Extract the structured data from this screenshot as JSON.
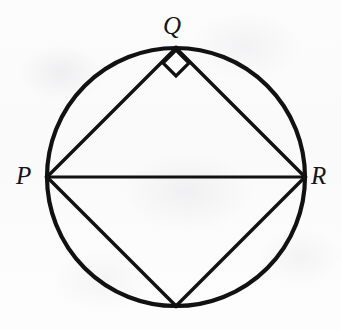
{
  "figure": {
    "kind": "geometry-diagram",
    "canvas": {
      "width": 341,
      "height": 330
    },
    "background_color": "#fdfdfd",
    "stroke_color": "#111111"
  },
  "circle": {
    "name": "circumscribed-circle",
    "center_x": 176,
    "center_y": 177,
    "radius": 129,
    "stroke_width": 4.2
  },
  "points": [
    {
      "id": "P",
      "label": "P",
      "x": 47,
      "y": 177,
      "labeled": true,
      "label_x": 16,
      "label_y": 163
    },
    {
      "id": "Q",
      "label": "Q",
      "x": 176,
      "y": 48,
      "labeled": true,
      "label_x": 163,
      "label_y": 13
    },
    {
      "id": "R",
      "label": "R",
      "x": 305,
      "y": 177,
      "labeled": true,
      "label_x": 311,
      "label_y": 163
    },
    {
      "id": "S",
      "label": "",
      "x": 176,
      "y": 306,
      "labeled": false,
      "label_x": 0,
      "label_y": 0
    }
  ],
  "segments": [
    {
      "name": "segment-PQ",
      "from": "P",
      "to": "Q",
      "x1": 47,
      "y1": 177,
      "x2": 176,
      "y2": 48,
      "stroke_width": 3.4
    },
    {
      "name": "segment-QR",
      "from": "Q",
      "to": "R",
      "x1": 176,
      "y1": 48,
      "x2": 305,
      "y2": 177,
      "stroke_width": 3.4
    },
    {
      "name": "segment-PR-diameter",
      "from": "P",
      "to": "R",
      "x1": 47,
      "y1": 177,
      "x2": 305,
      "y2": 177,
      "stroke_width": 3.2
    },
    {
      "name": "segment-PS",
      "from": "P",
      "to": "S",
      "x1": 47,
      "y1": 177,
      "x2": 176,
      "y2": 306,
      "stroke_width": 3.4
    },
    {
      "name": "segment-SR",
      "from": "S",
      "to": "R",
      "x1": 176,
      "y1": 306,
      "x2": 305,
      "y2": 177,
      "stroke_width": 3.4
    }
  ],
  "angle_markers": [
    {
      "name": "right-angle-marker-at-Q",
      "at_point": "Q",
      "type": "right-angle-square",
      "measure_degrees": 90,
      "center_x": 176,
      "center_y": 63,
      "half_diagonal": 13,
      "stroke_width": 3.2
    }
  ],
  "labels": {
    "P": "P",
    "Q": "Q",
    "R": "R"
  }
}
